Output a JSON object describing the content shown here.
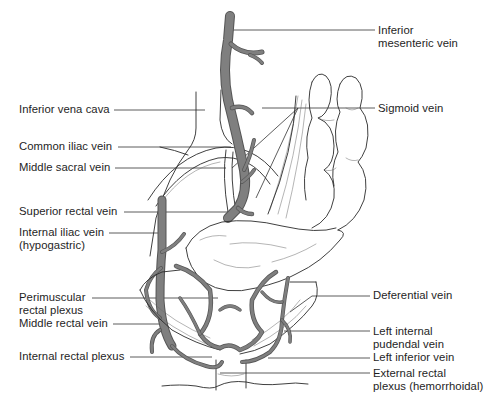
{
  "figure": {
    "colors": {
      "background": "#ffffff",
      "vein_fill": "#8a8a8a",
      "outline": "#2a2a2a",
      "label_text": "#1e1e1e"
    }
  },
  "labels_left": [
    {
      "id": "inferior-vena-cava",
      "lines": [
        "Inferior vena cava"
      ]
    },
    {
      "id": "common-iliac-vein",
      "lines": [
        "Common iliac vein"
      ]
    },
    {
      "id": "middle-sacral-vein",
      "lines": [
        "Middle sacral vein"
      ]
    },
    {
      "id": "superior-rectal-vein",
      "lines": [
        "Superior rectal vein"
      ]
    },
    {
      "id": "internal-iliac-vein",
      "lines": [
        "Internal iliac vein",
        "(hypogastric)"
      ]
    },
    {
      "id": "perimuscular-rectal-plexus",
      "lines": [
        "Perimuscular",
        "rectal plexus"
      ]
    },
    {
      "id": "middle-rectal-vein",
      "lines": [
        "Middle rectal vein"
      ]
    },
    {
      "id": "internal-rectal-plexus",
      "lines": [
        "Internal rectal plexus"
      ]
    }
  ],
  "labels_right": [
    {
      "id": "inferior-mesenteric-vein",
      "lines": [
        "Inferior",
        "mesenteric vein"
      ]
    },
    {
      "id": "sigmoid-vein",
      "lines": [
        "Sigmoid vein"
      ]
    },
    {
      "id": "deferential-vein",
      "lines": [
        "Deferential vein"
      ]
    },
    {
      "id": "left-internal-pudendal-vein",
      "lines": [
        "Left internal",
        "pudendal vein"
      ]
    },
    {
      "id": "left-inferior-vein",
      "lines": [
        "Left inferior vein"
      ]
    },
    {
      "id": "external-rectal-plexus",
      "lines": [
        "External rectal",
        "plexus (hemorrhoidal)"
      ]
    }
  ]
}
